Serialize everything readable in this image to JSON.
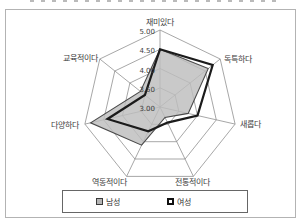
{
  "chart_data": {
    "type": "radar",
    "categories": [
      "재미있다",
      "독특하다",
      "새롭다",
      "전통적이다",
      "역동적이다",
      "다양하다",
      "교육적이다"
    ],
    "series": [
      {
        "name": "남성",
        "values": [
          4.5,
          4.6,
          3.75,
          3.3,
          4.1,
          4.85,
          3.65
        ],
        "fill": "#bdbdbd",
        "stroke": "#4a4a4a"
      },
      {
        "name": "여성",
        "values": [
          4.5,
          4.75,
          4.0,
          3.45,
          3.7,
          4.4,
          3.5
        ],
        "fill": "none",
        "stroke": "#1b1b1b"
      }
    ],
    "scale": {
      "min": 3.0,
      "max": 5.0,
      "step": 0.5,
      "tick_labels": [
        "5.00",
        "4.50",
        "4.00",
        "3.50",
        "3.00"
      ]
    },
    "grid_color": "#909090",
    "text_color": "#3c3c3c",
    "legend_position": "bottom"
  }
}
